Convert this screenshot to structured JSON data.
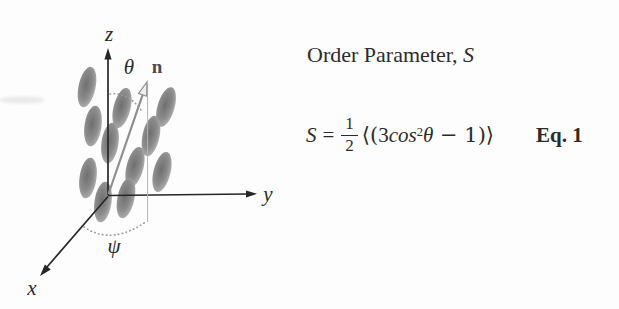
{
  "figure": {
    "labels": {
      "z_axis": "z",
      "y_axis": "y",
      "x_axis": "x",
      "theta": "θ",
      "psi": "ψ",
      "director": "n"
    },
    "molecule_size": {
      "rx": 8.5,
      "ry": 20.5
    },
    "molecules": [
      {
        "cx": 87,
        "cy": 87,
        "rot": 12
      },
      {
        "cx": 93,
        "cy": 126,
        "rot": 8
      },
      {
        "cx": 122,
        "cy": 108,
        "rot": 14
      },
      {
        "cx": 166,
        "cy": 107,
        "rot": 16
      },
      {
        "cx": 151,
        "cy": 136,
        "rot": 12
      },
      {
        "cx": 110,
        "cy": 143,
        "rot": 8
      },
      {
        "cx": 135,
        "cy": 167,
        "rot": 14
      },
      {
        "cx": 88,
        "cy": 178,
        "rot": 8
      },
      {
        "cx": 162,
        "cy": 172,
        "rot": 14
      },
      {
        "cx": 103,
        "cy": 202,
        "rot": 8
      },
      {
        "cx": 126,
        "cy": 198,
        "rot": 12
      }
    ],
    "colors": {
      "axis": "#262626",
      "label": "#2a2a2a",
      "director": "#8f8f8f",
      "director_label": "#4a4a4a",
      "dots": "#9a9a9a",
      "text": "#2b2b2b",
      "molecule_dark": "#6f6f6f",
      "molecule_mid": "#8c8c8c",
      "molecule_light": "#bdbdbd"
    }
  },
  "panel": {
    "title_prefix": "Order Parameter, ",
    "title_symbol": "S",
    "equation": {
      "lhs": "S",
      "equals": "=",
      "numerator": "1",
      "denominator": "2",
      "open": "⟨(",
      "coeff": "3",
      "func": "cos",
      "power": "2",
      "angle": "θ",
      "tail": " − 1)⟩",
      "tag": "Eq. 1"
    }
  }
}
